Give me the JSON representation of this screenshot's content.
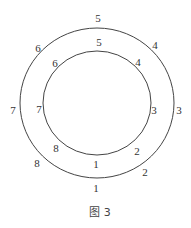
{
  "figure": {
    "caption": "图 3",
    "colors": {
      "stroke": "#444444",
      "text": "#333333",
      "background": "#ffffff"
    },
    "outer_circle": {
      "cx": 97,
      "cy": 103,
      "rx": 77,
      "ry": 75,
      "labels": [
        {
          "text": "5",
          "x": 98,
          "y": 22
        },
        {
          "text": "4",
          "x": 155,
          "y": 49
        },
        {
          "text": "3",
          "x": 179,
          "y": 114
        },
        {
          "text": "2",
          "x": 145,
          "y": 176
        },
        {
          "text": "1",
          "x": 96,
          "y": 192
        },
        {
          "text": "8",
          "x": 37,
          "y": 167
        },
        {
          "text": "7",
          "x": 13,
          "y": 114
        },
        {
          "text": "6",
          "x": 38,
          "y": 52
        }
      ]
    },
    "inner_circle": {
      "cx": 97,
      "cy": 103,
      "rx": 54,
      "ry": 52,
      "labels": [
        {
          "text": "5",
          "x": 99,
          "y": 46
        },
        {
          "text": "4",
          "x": 138,
          "y": 66
        },
        {
          "text": "3",
          "x": 154,
          "y": 114
        },
        {
          "text": "2",
          "x": 137,
          "y": 155
        },
        {
          "text": "1",
          "x": 96,
          "y": 168
        },
        {
          "text": "8",
          "x": 56,
          "y": 152
        },
        {
          "text": "7",
          "x": 39,
          "y": 113
        },
        {
          "text": "6",
          "x": 55,
          "y": 67
        }
      ]
    },
    "caption_pos": {
      "x": 100,
      "y": 216
    }
  }
}
